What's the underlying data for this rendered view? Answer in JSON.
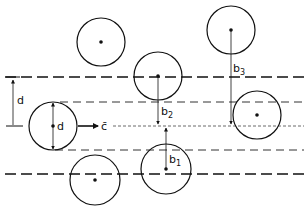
{
  "diagram": {
    "labels": {
      "d_outer": "d",
      "d_inner": "d",
      "velocity": "c̄",
      "b1": "b",
      "b1_sub": "1",
      "b2": "b",
      "b2_sub": "2",
      "b3": "b",
      "b3_sub": "3"
    },
    "spheres": [
      {
        "id": "top-left",
        "cx": 101,
        "cy": 42,
        "r": 24
      },
      {
        "id": "b2-target",
        "cx": 158,
        "cy": 76,
        "r": 24
      },
      {
        "id": "b3-target",
        "cx": 231,
        "cy": 30,
        "r": 24
      },
      {
        "id": "moving",
        "cx": 53,
        "cy": 126,
        "r": 24
      },
      {
        "id": "right",
        "cx": 257,
        "cy": 115,
        "r": 24
      },
      {
        "id": "b1-target",
        "cx": 166,
        "cy": 169,
        "r": 25
      },
      {
        "id": "bottom-left",
        "cx": 95,
        "cy": 180,
        "r": 25
      }
    ],
    "lines": {
      "outer_top_y": 77,
      "inner_top_y": 102,
      "axis_y": 126,
      "inner_bottom_y": 150,
      "outer_bottom_y": 174
    },
    "colors": {
      "stroke": "#111111",
      "background": "#ffffff"
    }
  }
}
